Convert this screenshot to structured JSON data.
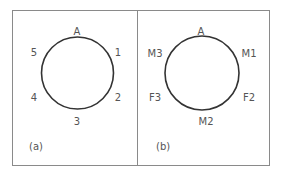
{
  "panels": [
    {
      "id": "a",
      "caption": "(a)",
      "circle": {
        "cx": 77.5,
        "cy": 73,
        "r": 36
      },
      "labels": [
        {
          "text": "A",
          "x": 77,
          "y": 35
        },
        {
          "text": "1",
          "x": 118,
          "y": 56
        },
        {
          "text": "2",
          "x": 118,
          "y": 101
        },
        {
          "text": "3",
          "x": 77,
          "y": 125
        },
        {
          "text": "4",
          "x": 34,
          "y": 101
        },
        {
          "text": "5",
          "x": 34,
          "y": 56
        }
      ]
    },
    {
      "id": "b",
      "caption": "(b)",
      "circle": {
        "cx": 202,
        "cy": 73,
        "r": 37
      },
      "labels": [
        {
          "text": "A",
          "x": 201,
          "y": 35
        },
        {
          "text": "M1",
          "x": 249,
          "y": 57
        },
        {
          "text": "F2",
          "x": 249,
          "y": 101
        },
        {
          "text": "M2",
          "x": 206,
          "y": 125
        },
        {
          "text": "F3",
          "x": 155,
          "y": 101
        },
        {
          "text": "M3",
          "x": 155,
          "y": 57
        }
      ]
    }
  ],
  "colors": {
    "border": "#8a8a8a",
    "circle": "#333333",
    "text": "#555555"
  }
}
